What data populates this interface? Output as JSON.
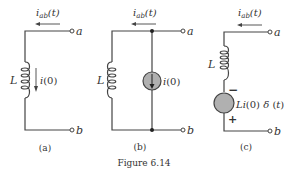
{
  "figure": {
    "caption": "Figure 6.14",
    "panels": [
      {
        "id": "a",
        "label": "(a)",
        "current_label": "i_ab(t)",
        "current_text": "i",
        "current_sub": "ab",
        "current_arg": "(t)",
        "terminal_top": "a",
        "terminal_bottom": "b",
        "inductor_label": "L",
        "initial_current_label": "i(0)"
      },
      {
        "id": "b",
        "label": "(b)",
        "current_text": "i",
        "current_sub": "ab",
        "current_arg": "(t)",
        "terminal_top": "a",
        "terminal_bottom": "b",
        "inductor_label": "L",
        "source_label": "i(0)"
      },
      {
        "id": "c",
        "label": "(c)",
        "current_text": "i",
        "current_sub": "ab",
        "current_arg": "(t)",
        "terminal_top": "a",
        "terminal_bottom": "b",
        "inductor_label": "L",
        "source_label": "Li(0) δ (t)",
        "polarity_top": "−",
        "polarity_bottom": "+"
      }
    ],
    "colors": {
      "wire": "#444444",
      "source_fill": "#b0b0b0",
      "text": "#333333"
    }
  }
}
